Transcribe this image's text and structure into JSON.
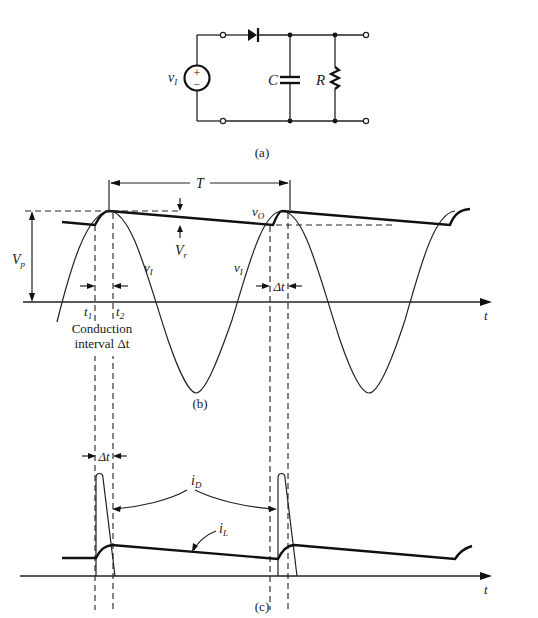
{
  "figure": {
    "circuit": {
      "caption": "(a)",
      "source_label": "v",
      "source_sub": "I",
      "source_plus": "+",
      "source_minus": "−",
      "capacitor_label": "C",
      "resistor_label": "R"
    },
    "voltage_plot": {
      "caption": "(b)",
      "period_label": "T",
      "vo_label": "v",
      "vo_sub": "O",
      "vi_label_1": "v",
      "vi_sub_1": "I",
      "vi_label_2": "v",
      "vi_sub_2": "I",
      "vp_label": "V",
      "vp_sub": "p",
      "vr_label": "V",
      "vr_sub": "r",
      "t1_label": "t",
      "t1_sub": "1",
      "t2_label": "t",
      "t2_sub": "2",
      "conduction_line1": "Conduction",
      "conduction_line2": "interval Δt",
      "delta_t_label": "Δt",
      "time_axis_label": "t"
    },
    "current_plot": {
      "caption": "(c)",
      "delta_t_label": "Δt",
      "id_label": "i",
      "id_sub": "D",
      "il_label": "i",
      "il_sub": "L",
      "time_axis_label": "t"
    }
  }
}
